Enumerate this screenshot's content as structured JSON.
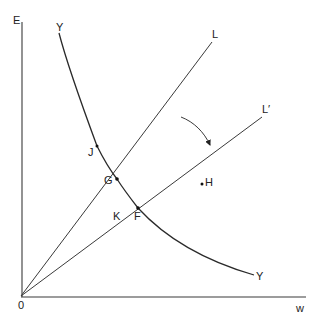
{
  "diagram": {
    "axes": {
      "y_label": "E",
      "x_label": "w",
      "origin_label": "0"
    },
    "curves": {
      "yy_top_label": "Y",
      "yy_bottom_label": "Y"
    },
    "lines": {
      "l_label": "L",
      "l_prime_label": "L′"
    },
    "points": {
      "j": "J",
      "g": "G",
      "k": "K",
      "f": "F",
      "h": "H"
    },
    "rotation_arrow": "rotate L to L′ (clockwise)",
    "colors": {
      "stroke": "#3a3a3a",
      "text": "#222222",
      "background": "#ffffff"
    }
  }
}
